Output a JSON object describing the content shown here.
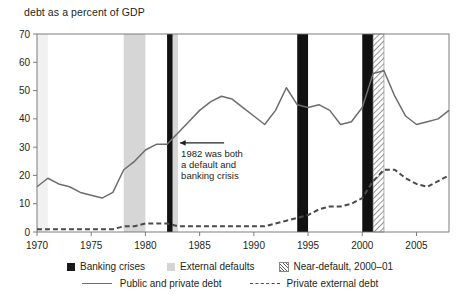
{
  "chart_data": {
    "type": "line",
    "title": "debt as a percent of GDP",
    "xlabel": "",
    "ylabel": "",
    "xlim": [
      1970,
      2008
    ],
    "ylim": [
      0,
      70
    ],
    "yticks": [
      0,
      10,
      20,
      30,
      40,
      50,
      60,
      70
    ],
    "xticks": [
      1970,
      1975,
      1980,
      1985,
      1990,
      1995,
      2000,
      2005
    ],
    "grid": false,
    "legend_position": "bottom",
    "x": [
      1970,
      1971,
      1972,
      1973,
      1974,
      1975,
      1976,
      1977,
      1978,
      1979,
      1980,
      1981,
      1982,
      1983,
      1984,
      1985,
      1986,
      1987,
      1988,
      1989,
      1990,
      1991,
      1992,
      1993,
      1994,
      1995,
      1996,
      1997,
      1998,
      1999,
      2000,
      2001,
      2002,
      2003,
      2004,
      2005,
      2006,
      2007,
      2008
    ],
    "series": [
      {
        "name": "Public and private debt",
        "style": "solid",
        "color": "#6d6d6d",
        "values": [
          16,
          19,
          17,
          16,
          14,
          13,
          12,
          14,
          22,
          25,
          29,
          31,
          31,
          35,
          39,
          43,
          46,
          48,
          47,
          44,
          41,
          38,
          43,
          51,
          45,
          44,
          45,
          43,
          38,
          39,
          44,
          56,
          57,
          48,
          41,
          38,
          39,
          40,
          43
        ]
      },
      {
        "name": "Private external debt",
        "style": "dashed",
        "color": "#4a4a4a",
        "values": [
          1,
          1,
          1,
          1,
          1,
          1,
          1,
          1,
          2,
          2,
          3,
          3,
          3,
          2,
          2,
          2,
          2,
          2,
          2,
          2,
          2,
          2,
          3,
          4,
          5,
          6,
          8,
          9,
          9,
          10,
          12,
          18,
          22,
          22,
          19,
          17,
          16,
          18,
          20
        ]
      }
    ],
    "bands": [
      {
        "type": "external-default",
        "label": "External defaults",
        "start": 1970,
        "end": 1971,
        "shade": "light"
      },
      {
        "type": "external-default",
        "label": "External defaults",
        "start": 1978,
        "end": 1980,
        "shade": "dark"
      },
      {
        "type": "external-default",
        "label": "External defaults",
        "start": 1982,
        "end": 1983,
        "shade": "dark"
      },
      {
        "type": "banking-crisis",
        "label": "Banking crises",
        "start": 1982,
        "end": 1982.5
      },
      {
        "type": "banking-crisis",
        "label": "Banking crises",
        "start": 1994,
        "end": 1995
      },
      {
        "type": "banking-crisis",
        "label": "Banking crises",
        "start": 2000,
        "end": 2001
      },
      {
        "type": "near-default",
        "label": "Near-default, 2000–01",
        "start": 2001,
        "end": 2002
      }
    ],
    "annotations": [
      {
        "id": "crisis-1982",
        "lines": [
          "1982 was both",
          "a default and",
          "banking crisis"
        ],
        "arrow": "left"
      }
    ]
  },
  "legend": {
    "row1": [
      {
        "key": "banking-crises",
        "swatch": "solid-black-square",
        "label": "Banking crises"
      },
      {
        "key": "external-defaults",
        "swatch": "gray-square",
        "label": "External defaults"
      },
      {
        "key": "near-default",
        "swatch": "hatched-square",
        "label": "Near-default, 2000–01"
      }
    ],
    "row2": [
      {
        "key": "public-private-debt",
        "swatch": "solid-line",
        "label": "Public and private debt"
      },
      {
        "key": "private-external-debt",
        "swatch": "dashed-line",
        "label": "Private external debt"
      }
    ]
  }
}
